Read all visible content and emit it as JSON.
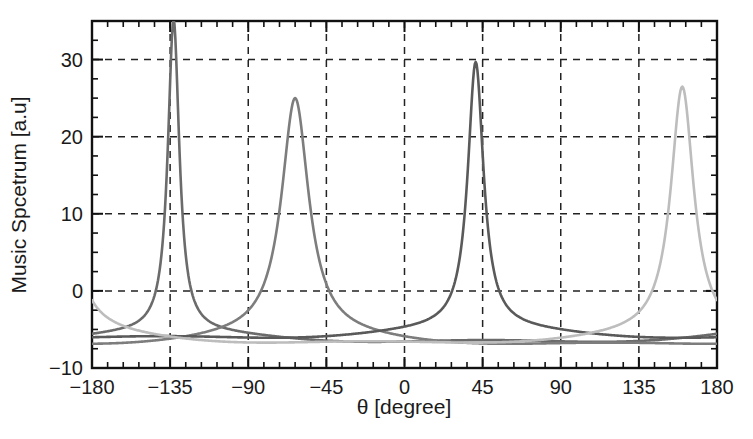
{
  "chart_data": {
    "type": "line",
    "title": "",
    "xlabel": "θ [degree]",
    "ylabel": "Music Spcetrum [a.u]",
    "xlim": [
      -180,
      180
    ],
    "ylim": [
      -10,
      35
    ],
    "xticks": [
      -180,
      -135,
      -90,
      -45,
      0,
      45,
      90,
      135,
      180
    ],
    "xtick_labels": [
      "−180",
      "−135",
      "−90",
      "−45",
      "0",
      "45",
      "90",
      "135",
      "180"
    ],
    "yticks": [
      -10,
      0,
      10,
      20,
      30
    ],
    "ytick_labels": [
      "−10",
      "0",
      "10",
      "20",
      "30"
    ],
    "xtick_minor_step": 9,
    "ytick_minor_step": 2.5,
    "grid": "dashed gridlines at major x ticks and y = 0, 10, 20, 30",
    "legend": "none",
    "series": [
      {
        "name": "source-1",
        "color": "#6b6b6b",
        "peak_angle": -133,
        "peak_value": 34.3,
        "half_width_deg": 4.0,
        "baseline": -6.2
      },
      {
        "name": "source-2",
        "color": "#7d7d7d",
        "peak_angle": -63,
        "peak_value": 24.1,
        "half_width_deg": 9.5,
        "baseline": -6.6
      },
      {
        "name": "source-3",
        "color": "#5a5a5a",
        "peak_angle": 41,
        "peak_value": 28.8,
        "half_width_deg": 5.5,
        "baseline": -5.7
      },
      {
        "name": "source-4",
        "color": "#bdbdbd",
        "peak_angle": 160,
        "peak_value": 25.6,
        "half_width_deg": 8.0,
        "baseline": -6.4
      }
    ],
    "edge_values": {
      "at_minus_180": [
        -2.0,
        -6.0,
        -6.2,
        7.0
      ],
      "at_plus_180": [
        -4.0,
        -6.0,
        -6.3,
        11.0
      ]
    }
  },
  "figure": {
    "axis_color": "#111111",
    "background": "#ffffff"
  }
}
